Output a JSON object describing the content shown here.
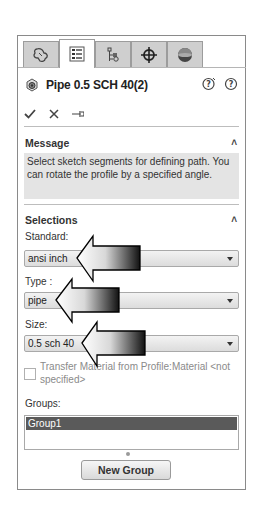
{
  "tabs": [
    {
      "name": "feature-manager",
      "icon": "parts-icon",
      "active": false
    },
    {
      "name": "property-manager",
      "icon": "property-list-icon",
      "active": true
    },
    {
      "name": "configuration-manager",
      "icon": "configuration-icon",
      "active": false
    },
    {
      "name": "dimxpert-manager",
      "icon": "crosshair-icon",
      "active": false
    },
    {
      "name": "display-manager",
      "icon": "appearance-sphere-icon",
      "active": false
    }
  ],
  "header": {
    "title": "Pipe 0.5 SCH 40(2)",
    "feature_icon": "pipe-feature-icon",
    "help_icons": [
      "whats-wrong-help-icon",
      "help-icon"
    ]
  },
  "actions": {
    "ok": "check-icon",
    "cancel": "close-icon",
    "pin": "pushpin-icon"
  },
  "message": {
    "heading": "Message",
    "text": "Select sketch segments for defining path. You can rotate the profile by a specified angle."
  },
  "selections": {
    "heading": "Selections",
    "standard_label": "Standard:",
    "standard_value": "ansi inch",
    "type_label": "Type :",
    "type_value": "pipe",
    "size_label": "Size:",
    "size_value": "0.5 sch 40",
    "transfer_material_label": "Transfer Material from Profile:Material <not specified>",
    "transfer_material_checked": false,
    "groups_label": "Groups:",
    "groups": [
      "Group1"
    ],
    "new_group_button": "New Group"
  },
  "colors": {
    "panel_border": "#8a8a8a",
    "tab_inactive": "#cfcfcf",
    "message_bg": "#e4e4e4",
    "selected_group_bg": "#5a5a5a"
  },
  "annotations": {
    "arrows": [
      {
        "points_to": "standard-select"
      },
      {
        "points_to": "type-select"
      },
      {
        "points_to": "size-select"
      }
    ]
  }
}
